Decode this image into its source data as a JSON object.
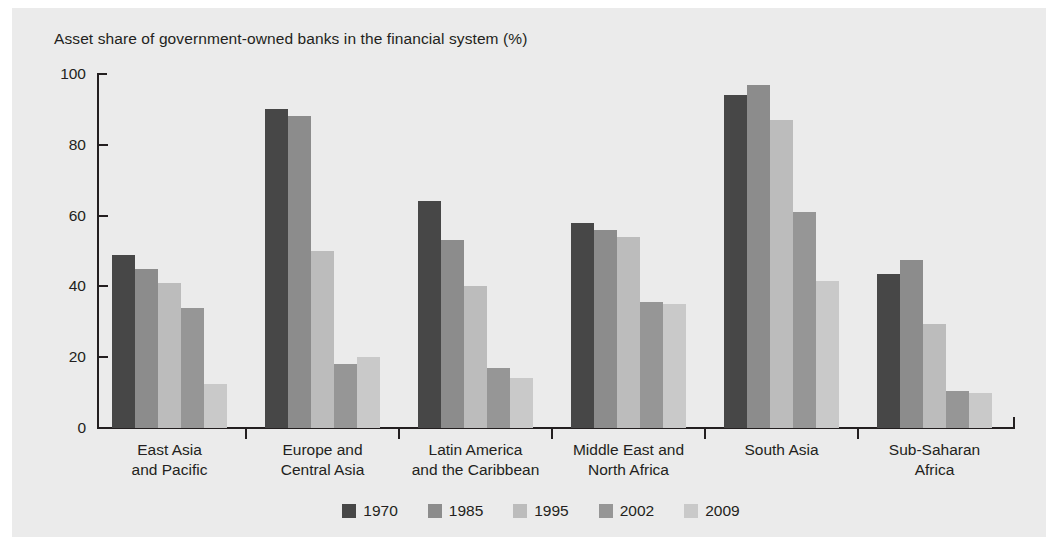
{
  "chart_data": {
    "type": "bar",
    "title": "Asset share of government-owned banks in the financial system (%)",
    "xlabel": "",
    "ylabel": "",
    "ylim": [
      0,
      100
    ],
    "yticks": [
      0,
      20,
      40,
      60,
      80,
      100
    ],
    "grid": false,
    "legend_position": "bottom-center",
    "categories": [
      "East Asia\nand Pacific",
      "Europe and\nCentral Asia",
      "Latin America\nand the Caribbean",
      "Middle East and\nNorth Africa",
      "South Asia",
      "Sub-Saharan\nAfrica"
    ],
    "series": [
      {
        "name": "1970",
        "color": "#474747",
        "values": [
          49,
          90,
          64,
          58,
          94,
          43.5
        ]
      },
      {
        "name": "1985",
        "color": "#8c8c8c",
        "values": [
          45,
          88,
          53,
          56,
          97,
          47.5
        ]
      },
      {
        "name": "1995",
        "color": "#bcbcbc",
        "values": [
          41,
          50,
          40,
          54,
          87,
          29.5
        ]
      },
      {
        "name": "2002",
        "color": "#969696",
        "values": [
          34,
          18,
          17,
          35.5,
          61,
          10.5
        ]
      },
      {
        "name": "2009",
        "color": "#c9c9c9",
        "values": [
          12.5,
          20,
          14,
          35,
          41.5,
          10
        ]
      }
    ]
  },
  "style": {
    "page_background": "#ffffff",
    "panel_background": "#ebebeb",
    "axis_color": "#231f20",
    "text_color": "#231f20"
  }
}
